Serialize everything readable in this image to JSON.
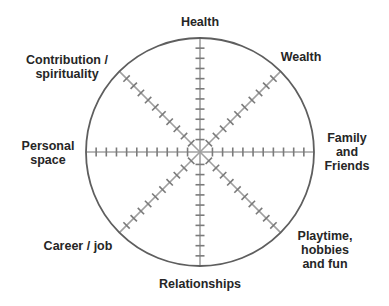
{
  "diagram": {
    "type": "wheel-of-life",
    "center": {
      "x": 200,
      "y": 152
    },
    "radius": 114,
    "ticks_per_spoke": 10,
    "colors": {
      "circle": "#5e5e5e",
      "spoke": "#a0a0a0",
      "tick": "#7a7a7a",
      "text": "#262626",
      "background": "#ffffff"
    },
    "segments": [
      {
        "id": "health",
        "label": "Health",
        "lines": [
          "Health"
        ],
        "angle": -90
      },
      {
        "id": "wealth",
        "label": "Wealth",
        "lines": [
          "Wealth"
        ],
        "angle": -45
      },
      {
        "id": "family",
        "label": "Family and Friends",
        "lines": [
          "Family",
          "and",
          "Friends"
        ],
        "angle": 0
      },
      {
        "id": "playtime",
        "label": "Playtime, hobbies and fun",
        "lines": [
          "Playtime,",
          "hobbies",
          "and fun"
        ],
        "angle": 45
      },
      {
        "id": "relationships",
        "label": "Relationships",
        "lines": [
          "Relationships"
        ],
        "angle": 90
      },
      {
        "id": "career",
        "label": "Career / job",
        "lines": [
          "Career / job"
        ],
        "angle": 135
      },
      {
        "id": "personal",
        "label": "Personal space",
        "lines": [
          "Personal",
          "space"
        ],
        "angle": 180
      },
      {
        "id": "contribution",
        "label": "Contribution / spirituality",
        "lines": [
          "Contribution /",
          "spirituality"
        ],
        "angle": -135
      }
    ]
  },
  "labels": {
    "health": {
      "lines": [
        "Health"
      ]
    },
    "wealth": {
      "lines": [
        "Wealth"
      ]
    },
    "family": {
      "lines": [
        "Family",
        "and",
        "Friends"
      ]
    },
    "playtime": {
      "lines": [
        "Playtime,",
        "hobbies",
        "and fun"
      ]
    },
    "relationships": {
      "lines": [
        "Relationships"
      ]
    },
    "career": {
      "lines": [
        "Career / job"
      ]
    },
    "personal": {
      "lines": [
        "Personal",
        "space"
      ]
    },
    "contribution": {
      "lines": [
        "Contribution /",
        "spirituality"
      ]
    }
  }
}
